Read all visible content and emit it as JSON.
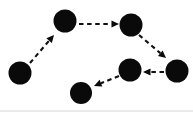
{
  "figure": {
    "width": 193,
    "height": 113,
    "background_color": "#ffffff",
    "node_color": "#0a0a0a",
    "edge_color": "#111111",
    "edge_style": "dashed",
    "arrow_style": "solid-triangle"
  },
  "graph": {
    "node_count": 6,
    "edge_count": 5,
    "nodes": [
      {
        "id": "n1",
        "label": "",
        "cx": 20,
        "cy": 73,
        "r": 11.5
      },
      {
        "id": "n2",
        "label": "",
        "cx": 65,
        "cy": 21,
        "r": 11.5
      },
      {
        "id": "n3",
        "label": "",
        "cx": 131,
        "cy": 25,
        "r": 11.5
      },
      {
        "id": "n4",
        "label": "",
        "cx": 177,
        "cy": 71,
        "r": 11.5
      },
      {
        "id": "n5",
        "label": "",
        "cx": 130,
        "cy": 70,
        "r": 11.5
      },
      {
        "id": "n6",
        "label": "",
        "cx": 81,
        "cy": 93,
        "r": 11.0
      }
    ],
    "edges": [
      {
        "id": "e1",
        "from": "n1",
        "to": "n2",
        "x1": 30,
        "y1": 63,
        "x2": 54,
        "y2": 35,
        "head_angle": -49
      },
      {
        "id": "e2",
        "from": "n2",
        "to": "n3",
        "x1": 79,
        "y1": 24,
        "x2": 119,
        "y2": 24,
        "head_angle": 0
      },
      {
        "id": "e3",
        "from": "n3",
        "to": "n4",
        "x1": 139,
        "y1": 35,
        "x2": 166,
        "y2": 58,
        "head_angle": 40
      },
      {
        "id": "e4",
        "from": "n4",
        "to": "n5",
        "x1": 164,
        "y1": 72,
        "x2": 143,
        "y2": 72,
        "head_angle": 180
      },
      {
        "id": "e5",
        "from": "n5",
        "to": "n6",
        "x1": 119,
        "y1": 76,
        "x2": 94,
        "y2": 86,
        "head_angle": 158
      }
    ]
  }
}
